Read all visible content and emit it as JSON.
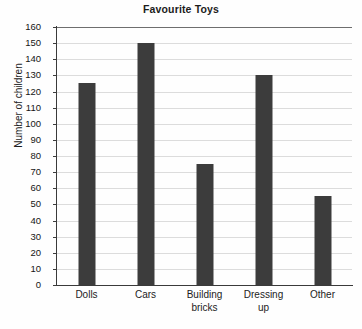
{
  "chart_data": {
    "type": "bar",
    "title": "Favourite Toys",
    "xlabel": "",
    "ylabel": "Number of children",
    "categories": [
      "Dolls",
      "Cars",
      "Building bricks",
      "Dressing up",
      "Other"
    ],
    "category_lines": [
      [
        "Dolls"
      ],
      [
        "Cars"
      ],
      [
        "Building",
        "bricks"
      ],
      [
        "Dressing",
        "up"
      ],
      [
        "Other"
      ]
    ],
    "values": [
      125,
      150,
      75,
      130,
      55
    ],
    "ylim": [
      0,
      160
    ],
    "ytick_step": 10,
    "yticks": [
      0,
      10,
      20,
      30,
      40,
      50,
      60,
      70,
      80,
      90,
      100,
      110,
      120,
      130,
      140,
      150,
      160
    ],
    "ytick_labels": [
      "0",
      "10",
      "20",
      "30",
      "40",
      "50",
      "60",
      "70",
      "80",
      "90",
      "100",
      "110",
      "120",
      "130",
      "140",
      "150",
      "160"
    ],
    "grid": true,
    "grid_axis": "y",
    "legend": false,
    "legend_position": "none",
    "bar_color": "#3c3c3c",
    "gridline_color": "#dcdcdc",
    "axis_color": "#3a3a3a",
    "background_color": "#fefefe"
  }
}
